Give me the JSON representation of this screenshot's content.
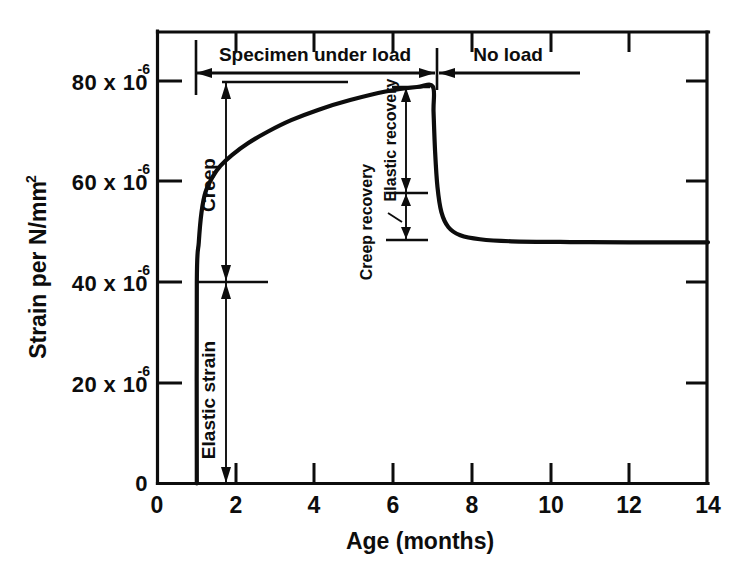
{
  "chart_data": {
    "type": "line",
    "title": "",
    "xlabel": "Age (months)",
    "ylabel": "Strain per N/mm",
    "ylabel_exponent": "2",
    "xlim": [
      0,
      14
    ],
    "ylim": [
      0,
      92
    ],
    "grid": false,
    "legend": "none",
    "x_ticks": [
      "0",
      "2",
      "4",
      "6",
      "8",
      "10",
      "12",
      "14"
    ],
    "x_tick_values": [
      0,
      2,
      4,
      6,
      8,
      10,
      12,
      14
    ],
    "y_ticks": [
      "0",
      "20 x 10",
      "40 x 10",
      "60 x 10",
      "80 x 10"
    ],
    "y_tick_values": [
      0,
      20,
      40,
      60,
      80
    ],
    "y_tick_exponent": "-6",
    "y_zero_label": "0",
    "series": [
      {
        "name": "strain",
        "description": "Elastic strain at 1 month, creep to 7 months, elastic recovery then creep recovery",
        "points": [
          [
            1.0,
            0
          ],
          [
            1.0,
            40
          ],
          [
            1.05,
            48
          ],
          [
            1.12,
            54
          ],
          [
            1.22,
            58
          ],
          [
            1.4,
            61
          ],
          [
            1.6,
            63.2
          ],
          [
            1.9,
            65.4
          ],
          [
            2.3,
            67.7
          ],
          [
            2.8,
            70.0
          ],
          [
            3.4,
            72.3
          ],
          [
            4.1,
            74.4
          ],
          [
            4.9,
            76.3
          ],
          [
            5.8,
            78.0
          ],
          [
            6.6,
            78.9
          ],
          [
            7.0,
            79.0
          ],
          [
            7.02,
            74
          ],
          [
            7.06,
            66
          ],
          [
            7.12,
            59
          ],
          [
            7.22,
            54
          ],
          [
            7.4,
            51
          ],
          [
            7.7,
            49.4
          ],
          [
            8.2,
            48.6
          ],
          [
            9.0,
            48.2
          ],
          [
            10.5,
            48.05
          ],
          [
            12.0,
            48.0
          ],
          [
            14.0,
            48.0
          ]
        ]
      }
    ],
    "annotations": [
      {
        "name": "specimen-under-load",
        "label": "Specimen under load",
        "type": "span-bracket",
        "x_from": 1.0,
        "x_to": 7.0
      },
      {
        "name": "no-load",
        "label": "No load",
        "type": "span-bracket",
        "x_from": 7.0,
        "x_to": 14.0
      },
      {
        "name": "creep",
        "label": "Creep",
        "type": "vertical-dimension",
        "x": 1.7,
        "y_from": 40,
        "y_to": 80
      },
      {
        "name": "elastic-strain",
        "label": "Elastic strain",
        "type": "vertical-dimension",
        "x": 1.7,
        "y_from": 0,
        "y_to": 40
      },
      {
        "name": "elastic-recovery",
        "label": "Elastic recovery",
        "type": "vertical-dimension",
        "x": 6.1,
        "y_from": 58,
        "y_to": 79
      },
      {
        "name": "creep-recovery",
        "label": "Creep recovery",
        "type": "vertical-dimension",
        "x": 6.1,
        "y_from": 48,
        "y_to": 58
      }
    ]
  },
  "figure": {
    "background_color": "#ffffff",
    "ink_color": "#0d0d0d"
  }
}
